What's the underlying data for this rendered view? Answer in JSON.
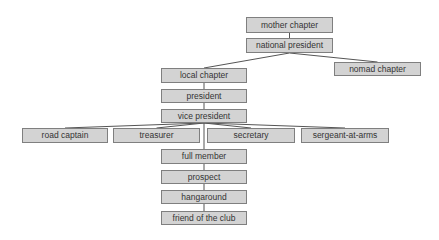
{
  "diagram": {
    "type": "org-chart",
    "colors": {
      "box_fill": "#d3d3d3",
      "box_border": "#7f7f7f",
      "text": "#333333",
      "line": "#555555"
    },
    "nodes": [
      {
        "id": "mother_chapter",
        "label": "mother chapter",
        "x": 246,
        "y": 17,
        "w": 87,
        "h": 16
      },
      {
        "id": "national_president",
        "label": "national president",
        "x": 246,
        "y": 38,
        "w": 87,
        "h": 15
      },
      {
        "id": "local_chapter",
        "label": "local chapter",
        "x": 161,
        "y": 68,
        "w": 86,
        "h": 15
      },
      {
        "id": "nomad_chapter",
        "label": "nomad chapter",
        "x": 334,
        "y": 62,
        "w": 87,
        "h": 14
      },
      {
        "id": "president",
        "label": "president",
        "x": 161,
        "y": 89,
        "w": 86,
        "h": 14
      },
      {
        "id": "vice_president",
        "label": "vice president",
        "x": 161,
        "y": 109,
        "w": 86,
        "h": 14
      },
      {
        "id": "road_captain",
        "label": "road captain",
        "x": 22,
        "y": 128,
        "w": 86,
        "h": 15
      },
      {
        "id": "treasurer",
        "label": "treasurer",
        "x": 113,
        "y": 128,
        "w": 87,
        "h": 15
      },
      {
        "id": "secretary",
        "label": "secretary",
        "x": 207,
        "y": 128,
        "w": 88,
        "h": 15
      },
      {
        "id": "sergeant_at_arms",
        "label": "sergeant-at-arms",
        "x": 301,
        "y": 128,
        "w": 88,
        "h": 15
      },
      {
        "id": "full_member",
        "label": "full member",
        "x": 161,
        "y": 149,
        "w": 86,
        "h": 15
      },
      {
        "id": "prospect",
        "label": "prospect",
        "x": 161,
        "y": 170,
        "w": 86,
        "h": 14
      },
      {
        "id": "hangaround",
        "label": "hangaround",
        "x": 161,
        "y": 190,
        "w": 86,
        "h": 14
      },
      {
        "id": "friend_of_the_club",
        "label": "friend of the club",
        "x": 161,
        "y": 211,
        "w": 86,
        "h": 14
      }
    ],
    "edges": [
      {
        "from": "mother_chapter",
        "to": "national_president"
      },
      {
        "from": "national_president",
        "to": "local_chapter"
      },
      {
        "from": "national_president",
        "to": "nomad_chapter"
      },
      {
        "from": "local_chapter",
        "to": "president"
      },
      {
        "from": "president",
        "to": "vice_president"
      },
      {
        "from": "vice_president",
        "to": "road_captain"
      },
      {
        "from": "vice_president",
        "to": "treasurer"
      },
      {
        "from": "vice_president",
        "to": "secretary"
      },
      {
        "from": "vice_president",
        "to": "sergeant_at_arms"
      },
      {
        "from": "vice_president",
        "to": "full_member"
      },
      {
        "from": "full_member",
        "to": "prospect"
      },
      {
        "from": "prospect",
        "to": "hangaround"
      },
      {
        "from": "hangaround",
        "to": "friend_of_the_club"
      }
    ]
  }
}
